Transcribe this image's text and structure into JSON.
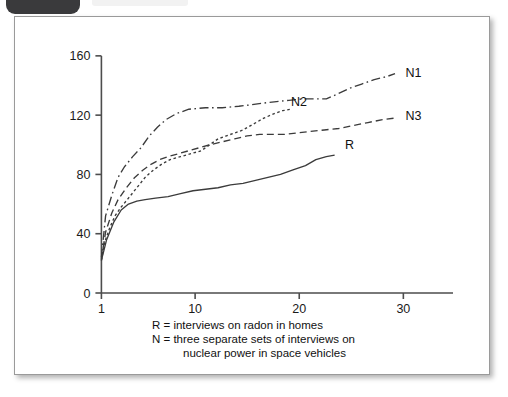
{
  "figure": {
    "badge_label": "",
    "frame_color": "#9a9a9a"
  },
  "caption": {
    "line1": "R = interviews on radon in homes",
    "line2": "N = three separate sets of interviews on",
    "line3": "nuclear power in space vehicles"
  },
  "chart_data": {
    "type": "line",
    "title": "",
    "xlabel": "",
    "ylabel": "",
    "xlim": [
      0,
      34
    ],
    "ylim": [
      0,
      168
    ],
    "xticks": [
      1,
      10,
      20,
      30
    ],
    "xtick_labels": [
      "1",
      "10",
      "20",
      "30"
    ],
    "yticks": [
      0,
      40,
      80,
      120,
      160
    ],
    "ytick_labels": [
      "0",
      "40",
      "80",
      "120",
      "160"
    ],
    "grid": false,
    "legend": "inline-right-of-line-ends",
    "series": [
      {
        "name": "N1",
        "label": "N1",
        "style": "dash-dot",
        "color": "#3b3b3b",
        "label_x": 30.2,
        "label_y": 149,
        "x": [
          1,
          1.4,
          2,
          2.6,
          3.2,
          4,
          4.8,
          5.6,
          6.4,
          7.2,
          8.2,
          9.4,
          11,
          12.6,
          14.2,
          15.4,
          16.4,
          17.6,
          19,
          20.4,
          21.6,
          22.6,
          23.6,
          24.8,
          26,
          27.2,
          28.4,
          29.2
        ],
        "y": [
          24,
          52,
          66,
          78,
          85,
          92,
          98,
          106,
          112,
          117,
          121,
          124,
          125,
          125,
          126,
          127,
          128,
          129,
          130,
          131,
          131,
          131,
          134,
          138,
          141,
          144,
          146,
          148
        ]
      },
      {
        "name": "N2",
        "label": "N2",
        "style": "fine-dotted",
        "color": "#3b3b3b",
        "label_x": 19.2,
        "label_y": 129,
        "x": [
          1,
          1.3,
          1.8,
          2.3,
          2.9,
          3.6,
          4.4,
          5.2,
          6,
          6.8,
          7.6,
          8.6,
          9.6,
          10.6,
          11.4,
          12.2,
          13,
          13.8,
          14.6,
          15.6,
          16.6,
          17.6,
          18.4,
          19.2
        ],
        "y": [
          22,
          34,
          44,
          52,
          58,
          64,
          71,
          78,
          83,
          87,
          90,
          92,
          94,
          96,
          100,
          104,
          106,
          108,
          110,
          114,
          118,
          121,
          123,
          124
        ]
      },
      {
        "name": "N3",
        "label": "N3",
        "style": "dashed",
        "color": "#3b3b3b",
        "label_x": 30.2,
        "label_y": 120,
        "x": [
          1,
          1.4,
          2,
          2.6,
          3.4,
          4.2,
          5,
          5.8,
          6.6,
          7.4,
          8.4,
          9.4,
          10.4,
          11.4,
          12.6,
          13.8,
          15,
          16.2,
          17.4,
          18.6,
          19.8,
          21,
          22.4,
          23.8,
          25.2,
          26.6,
          28,
          29.2
        ],
        "y": [
          23,
          41,
          54,
          63,
          71,
          78,
          83,
          87,
          90,
          92,
          94,
          96,
          98,
          100,
          102,
          104,
          106,
          107,
          107,
          107,
          108,
          109,
          110,
          111,
          113,
          115,
          117,
          118
        ]
      },
      {
        "name": "R",
        "label": "R",
        "style": "solid",
        "color": "#3b3b3b",
        "label_x": 24.4,
        "label_y": 100,
        "x": [
          1,
          1.5,
          2.2,
          2.9,
          3.6,
          4.4,
          5.2,
          6.2,
          7.4,
          8.6,
          9.8,
          11,
          12.2,
          13.4,
          14.6,
          15.8,
          17,
          18.2,
          19.4,
          20.6,
          21.6,
          22.6,
          23.4
        ],
        "y": [
          22,
          36,
          48,
          56,
          60,
          62,
          63,
          64,
          65,
          67,
          69,
          70,
          71,
          73,
          74,
          76,
          78,
          80,
          83,
          86,
          90,
          92,
          93
        ]
      }
    ]
  }
}
